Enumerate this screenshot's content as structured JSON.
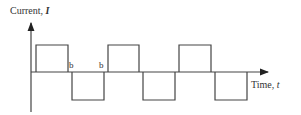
{
  "diagram": {
    "type": "waveform",
    "y_axis": {
      "label": "Current, ",
      "symbol": "I"
    },
    "x_axis": {
      "label": "Time, ",
      "symbol": "t"
    },
    "markers": [
      "b",
      "b"
    ],
    "waveform": {
      "shape": "square wave with gaps",
      "segments": [
        {
          "level": "high",
          "x_start": 36,
          "x_end": 68
        },
        {
          "level": "low",
          "x_start": 72,
          "x_end": 104
        },
        {
          "level": "high",
          "x_start": 108,
          "x_end": 139
        },
        {
          "level": "low",
          "x_start": 143,
          "x_end": 175
        },
        {
          "level": "high",
          "x_start": 179,
          "x_end": 211
        },
        {
          "level": "low",
          "x_start": 215,
          "x_end": 247
        }
      ]
    },
    "colors": {
      "line": "#444444",
      "text": "#333333"
    }
  }
}
